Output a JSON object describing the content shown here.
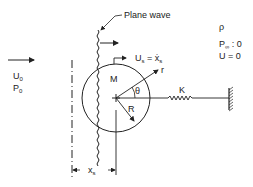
{
  "diagram": {
    "type": "physical-system-schematic",
    "labels": {
      "plane_wave": "Plane wave",
      "incident_velocity": {
        "main": "U",
        "sub": "0"
      },
      "incident_pressure": {
        "main": "P",
        "sub": "0"
      },
      "mass": "M",
      "sphere_velocity": {
        "main": "U",
        "sub": "s",
        "eq": " = ",
        "rhs": "ẋ",
        "rhs_sub": "s"
      },
      "radial_coord": "r",
      "angle": "θ",
      "radius": "R",
      "spring": "K",
      "displacement": {
        "main": "x",
        "sub": "s"
      },
      "density": "ρ",
      "far_pressure": {
        "main": "P",
        "sub": "∞",
        "eq": " : 0"
      },
      "far_velocity": {
        "main": "U",
        "eq": " = 0"
      }
    },
    "colors": {
      "line": "#222222",
      "background": "#ffffff"
    }
  }
}
